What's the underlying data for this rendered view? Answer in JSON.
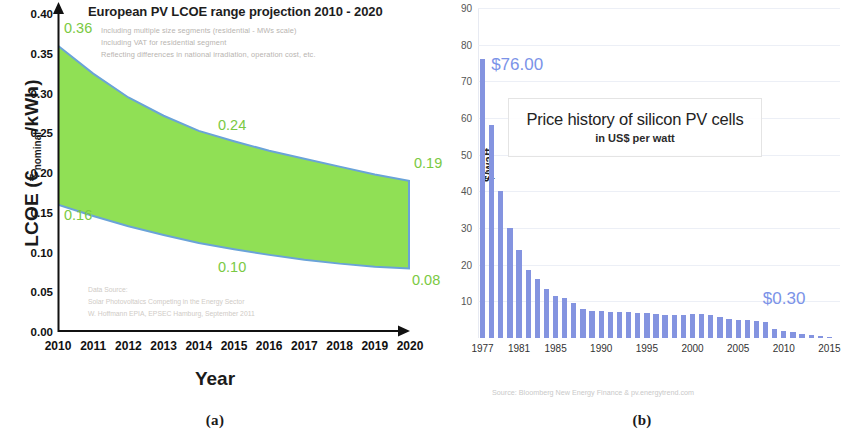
{
  "figure": {
    "panels": [
      {
        "caption": "(a)"
      },
      {
        "caption": "(b)"
      }
    ]
  },
  "panel_a": {
    "caption": "(a)",
    "title": "European PV LCOE range projection 2010 - 2020",
    "subtitle_lines": [
      "Including multiple size segments (residential - MWs scale)",
      "Including VAT for residential segment",
      "Reflecting differences in national irradiation, operation cost, etc."
    ],
    "source_lines": [
      "Data Source:",
      "Solar Photovoltaics Competing in the Energy Sector",
      "W. Hoffmann EPIA, EPSEC Hamburg, September 2011"
    ],
    "band_color": "#90e055",
    "edge_color": "#6aa3d8",
    "annotation_color": "#7ac943",
    "chart_data": {
      "type": "area",
      "title": "European PV LCOE range projection 2010 - 2020",
      "xlabel": "Year",
      "ylabel": "LCOE (€nominal/kWh)",
      "xlim": [
        2010,
        2020
      ],
      "ylim": [
        0.0,
        0.4
      ],
      "grid": false,
      "legend": "none",
      "xticks": [
        "2010",
        "2011",
        "2012",
        "2013",
        "2014",
        "2015",
        "2016",
        "2017",
        "2018",
        "2019",
        "2020"
      ],
      "yticks": [
        "0.00",
        "0.05",
        "0.10",
        "0.15",
        "0.20",
        "0.25",
        "0.30",
        "0.35",
        "0.40"
      ],
      "x": [
        2010,
        2011,
        2012,
        2013,
        2014,
        2015,
        2016,
        2017,
        2018,
        2019,
        2020
      ],
      "series": [
        {
          "name": "Upper bound (high LCOE)",
          "values": [
            0.36,
            0.325,
            0.295,
            0.272,
            0.253,
            0.24,
            0.228,
            0.218,
            0.208,
            0.198,
            0.19
          ]
        },
        {
          "name": "Lower bound (low LCOE)",
          "values": [
            0.16,
            0.146,
            0.133,
            0.122,
            0.112,
            0.104,
            0.097,
            0.091,
            0.086,
            0.082,
            0.08
          ]
        }
      ],
      "annotations": [
        {
          "label": "0.36",
          "x": 2010,
          "y": 0.36,
          "position": "upper-left"
        },
        {
          "label": "0.24",
          "x": 2015,
          "y": 0.24,
          "position": "upper-mid"
        },
        {
          "label": "0.19",
          "x": 2020,
          "y": 0.19,
          "position": "upper-right"
        },
        {
          "label": "0.16",
          "x": 2010,
          "y": 0.16,
          "position": "lower-left"
        },
        {
          "label": "0.10",
          "x": 2015,
          "y": 0.1,
          "position": "lower-mid"
        },
        {
          "label": "0.08",
          "x": 2020,
          "y": 0.08,
          "position": "lower-right"
        }
      ]
    }
  },
  "panel_b": {
    "caption": "(b)",
    "title_main": "Price history of silicon PV cells",
    "title_sub": "in US$ per watt",
    "source": "Source: Bloomberg New Energy Finance & pv.energytrend.com",
    "bar_color": "#8494e0",
    "callout_color": "#7b93e8",
    "callouts": [
      {
        "label": "$76.00",
        "year": 1977
      },
      {
        "label": "$0.30",
        "year": 2015
      }
    ],
    "chart_data": {
      "type": "bar",
      "title": "Price history of silicon PV cells",
      "subtitle": "in US$ per watt",
      "xlabel": "",
      "ylabel": "$/watt",
      "ylim": [
        0,
        90
      ],
      "grid": true,
      "legend": "none",
      "yticks": [
        "10",
        "20",
        "30",
        "40",
        "50",
        "60",
        "70",
        "80",
        "90"
      ],
      "xticks_shown": [
        "1977",
        "1981",
        "1985",
        "1990",
        "1995",
        "2000",
        "2005",
        "2010",
        "2015"
      ],
      "categories": [
        "1977",
        "1978",
        "1979",
        "1980",
        "1981",
        "1982",
        "1983",
        "1984",
        "1985",
        "1986",
        "1987",
        "1988",
        "1989",
        "1990",
        "1991",
        "1992",
        "1993",
        "1994",
        "1995",
        "1996",
        "1997",
        "1998",
        "1999",
        "2000",
        "2001",
        "2002",
        "2003",
        "2004",
        "2005",
        "2006",
        "2007",
        "2008",
        "2009",
        "2010",
        "2011",
        "2012",
        "2013",
        "2014",
        "2015"
      ],
      "values": [
        76.0,
        58.0,
        40.0,
        30.0,
        24.0,
        18.5,
        16.0,
        13.5,
        11.5,
        11.0,
        9.5,
        8.0,
        7.5,
        7.3,
        7.2,
        7.1,
        7.0,
        6.9,
        6.8,
        6.5,
        6.3,
        6.2,
        6.4,
        6.6,
        6.5,
        6.2,
        5.8,
        5.3,
        5.0,
        4.8,
        4.6,
        4.3,
        2.5,
        2.0,
        1.6,
        1.2,
        0.9,
        0.6,
        0.3
      ]
    }
  }
}
